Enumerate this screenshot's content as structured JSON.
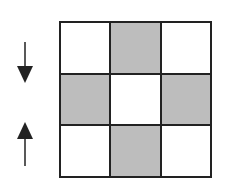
{
  "diagram": {
    "grid": {
      "rows": 3,
      "cols": 3,
      "cells": [
        [
          "white",
          "shaded",
          "white"
        ],
        [
          "shaded",
          "white",
          "shaded"
        ],
        [
          "white",
          "shaded",
          "white"
        ]
      ]
    },
    "arrows": [
      {
        "direction": "down",
        "position": "left-upper"
      },
      {
        "direction": "up",
        "position": "left-lower"
      }
    ],
    "colors": {
      "line": "#222222",
      "shaded": "#bdbdbd",
      "white": "#ffffff"
    }
  }
}
